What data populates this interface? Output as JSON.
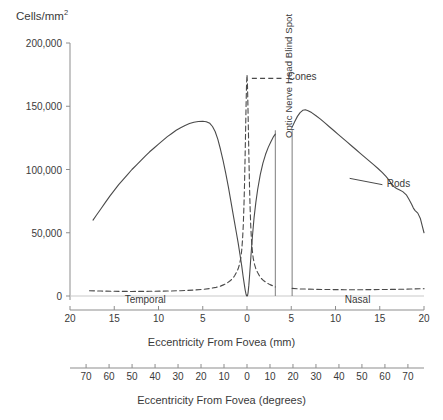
{
  "chart_data": {
    "type": "line",
    "title": "",
    "ylabel": "Cells/mm²",
    "ylabel_base": "Cells/mm",
    "ylabel_sup": "2",
    "ylim": [
      0,
      200000
    ],
    "yticks": [
      0,
      50000,
      100000,
      150000,
      200000
    ],
    "ytick_labels": [
      "0",
      "50,000",
      "100,000",
      "150,000",
      "200,000"
    ],
    "grid": false,
    "legend_position": "inside-top-center",
    "axes": [
      {
        "name": "mm-axis",
        "xlabel": "Eccentricity From Fovea (mm)",
        "xlim": [
          -20,
          20
        ],
        "xticks": [
          -20,
          -15,
          -10,
          -5,
          0,
          5,
          10,
          15,
          20
        ],
        "xtick_labels": [
          "20",
          "15",
          "10",
          "5",
          "0",
          "5",
          "10",
          "15",
          "20"
        ]
      },
      {
        "name": "degrees-axis",
        "xlabel": "Eccentricity From Fovea (degrees)",
        "xlim": [
          -77,
          77
        ],
        "xticks": [
          -70,
          -60,
          -50,
          -40,
          -30,
          -20,
          -10,
          0,
          10,
          20,
          30,
          40,
          50,
          60,
          70
        ],
        "xtick_labels": [
          "70",
          "60",
          "50",
          "40",
          "30",
          "20",
          "10",
          "0",
          "10",
          "20",
          "30",
          "40",
          "50",
          "60",
          "70"
        ]
      }
    ],
    "region_labels": [
      {
        "text": "Temporal",
        "x": -11.5
      },
      {
        "text": "Nasal",
        "x": 12.5
      }
    ],
    "annotations": [
      {
        "text": "Optic Nerve Head Blind Spot",
        "x_start": 3.2,
        "x_end": 5.1,
        "orientation": "vertical"
      }
    ],
    "blind_spot": {
      "x_start": 3.2,
      "x_end": 5.1
    },
    "series": [
      {
        "name": "Rods",
        "style": "solid",
        "color": "#4a4a4a",
        "label_x": 13.5,
        "label_y": 88000,
        "segments": [
          {
            "points": [
              [
                -17.4,
                60000
              ],
              [
                -17.0,
                64000
              ],
              [
                -16.5,
                69000
              ],
              [
                -16.0,
                74000
              ],
              [
                -15.5,
                79000
              ],
              [
                -15.0,
                83500
              ],
              [
                -14.5,
                88000
              ],
              [
                -14.0,
                92000
              ],
              [
                -13.5,
                96000
              ],
              [
                -13.0,
                100000
              ],
              [
                -12.5,
                103500
              ],
              [
                -12.0,
                107000
              ],
              [
                -11.5,
                110500
              ],
              [
                -11.0,
                114000
              ],
              [
                -10.5,
                117000
              ],
              [
                -10.0,
                120000
              ],
              [
                -9.5,
                123000
              ],
              [
                -9.0,
                126000
              ],
              [
                -8.5,
                128500
              ],
              [
                -8.0,
                131000
              ],
              [
                -7.5,
                133000
              ],
              [
                -7.0,
                134800
              ],
              [
                -6.5,
                136300
              ],
              [
                -6.0,
                137400
              ],
              [
                -5.5,
                138000
              ],
              [
                -5.0,
                138200
              ],
              [
                -4.6,
                137800
              ],
              [
                -4.2,
                136500
              ],
              [
                -3.9,
                134000
              ],
              [
                -3.6,
                130000
              ],
              [
                -3.3,
                124000
              ],
              [
                -3.0,
                116000
              ],
              [
                -2.7,
                107000
              ],
              [
                -2.4,
                97000
              ],
              [
                -2.1,
                86000
              ],
              [
                -1.8,
                74000
              ],
              [
                -1.5,
                62000
              ],
              [
                -1.2,
                50000
              ],
              [
                -1.0,
                42000
              ],
              [
                -0.8,
                33000
              ],
              [
                -0.6,
                24000
              ],
              [
                -0.45,
                16000
              ],
              [
                -0.3,
                9000
              ],
              [
                -0.2,
                4500
              ],
              [
                -0.12,
                1800
              ],
              [
                -0.06,
                400
              ],
              [
                0,
                0
              ],
              [
                0.06,
                400
              ],
              [
                0.12,
                2500
              ],
              [
                0.2,
                8000
              ],
              [
                0.3,
                17000
              ],
              [
                0.45,
                32000
              ],
              [
                0.6,
                46000
              ],
              [
                0.8,
                62000
              ],
              [
                1.0,
                74000
              ],
              [
                1.2,
                84000
              ],
              [
                1.5,
                96000
              ],
              [
                1.8,
                105000
              ],
              [
                2.1,
                112000
              ],
              [
                2.4,
                117500
              ],
              [
                2.7,
                122000
              ],
              [
                3.0,
                126000
              ],
              [
                3.2,
                128000
              ]
            ]
          },
          {
            "points": [
              [
                5.1,
                133500
              ],
              [
                5.4,
                138000
              ],
              [
                5.7,
                142000
              ],
              [
                6.0,
                145000
              ],
              [
                6.3,
                146800
              ],
              [
                6.6,
                147200
              ],
              [
                6.9,
                146500
              ],
              [
                7.3,
                145000
              ],
              [
                7.8,
                142500
              ],
              [
                8.3,
                139800
              ],
              [
                8.8,
                136800
              ],
              [
                9.3,
                133800
              ],
              [
                9.8,
                130800
              ],
              [
                10.3,
                127800
              ],
              [
                10.8,
                124800
              ],
              [
                11.3,
                121800
              ],
              [
                11.8,
                118800
              ],
              [
                12.3,
                115800
              ],
              [
                12.8,
                112800
              ],
              [
                13.3,
                109800
              ],
              [
                13.8,
                106800
              ],
              [
                14.3,
                103800
              ],
              [
                14.8,
                100800
              ],
              [
                15.3,
                97500
              ],
              [
                15.7,
                94500
              ],
              [
                16.0,
                92000
              ],
              [
                16.3,
                89000
              ],
              [
                16.6,
                86500
              ],
              [
                16.9,
                85000
              ],
              [
                17.2,
                84000
              ],
              [
                17.6,
                82500
              ],
              [
                18.0,
                80000
              ],
              [
                18.3,
                76500
              ],
              [
                18.6,
                72500
              ],
              [
                18.8,
                69500
              ],
              [
                19.0,
                67500
              ],
              [
                19.3,
                65500
              ],
              [
                19.6,
                61000
              ],
              [
                19.8,
                55500
              ],
              [
                20.0,
                50000
              ]
            ]
          }
        ]
      },
      {
        "name": "Cones",
        "style": "dashed",
        "color": "#4a4a4a",
        "legend_label_x": 4.6,
        "legend_label_y": 172000,
        "segments": [
          {
            "points": [
              [
                -17.8,
                4200
              ],
              [
                -16.5,
                3900
              ],
              [
                -15.0,
                3700
              ],
              [
                -13.0,
                3600
              ],
              [
                -11.0,
                3700
              ],
              [
                -9.0,
                3900
              ],
              [
                -7.5,
                4200
              ],
              [
                -6.0,
                4700
              ],
              [
                -5.0,
                5200
              ],
              [
                -4.2,
                5900
              ],
              [
                -3.5,
                6800
              ],
              [
                -3.0,
                7800
              ],
              [
                -2.6,
                9000
              ],
              [
                -2.2,
                10500
              ],
              [
                -1.9,
                12000
              ],
              [
                -1.6,
                14000
              ],
              [
                -1.4,
                16000
              ],
              [
                -1.2,
                18500
              ],
              [
                -1.0,
                21500
              ],
              [
                -0.85,
                25000
              ],
              [
                -0.7,
                30000
              ],
              [
                -0.6,
                36000
              ],
              [
                -0.5,
                45000
              ],
              [
                -0.42,
                56000
              ],
              [
                -0.35,
                70000
              ],
              [
                -0.28,
                88000
              ],
              [
                -0.22,
                108000
              ],
              [
                -0.16,
                130000
              ],
              [
                -0.1,
                152000
              ],
              [
                -0.05,
                168000
              ],
              [
                0,
                175000
              ],
              [
                0.05,
                168000
              ],
              [
                0.1,
                152000
              ],
              [
                0.16,
                130000
              ],
              [
                0.22,
                108000
              ],
              [
                0.28,
                88000
              ],
              [
                0.35,
                70000
              ],
              [
                0.42,
                56000
              ],
              [
                0.5,
                45000
              ],
              [
                0.6,
                36000
              ],
              [
                0.7,
                30000
              ],
              [
                0.85,
                25000
              ],
              [
                1.0,
                21500
              ],
              [
                1.2,
                18500
              ],
              [
                1.4,
                16000
              ],
              [
                1.6,
                14000
              ],
              [
                1.9,
                12000
              ],
              [
                2.2,
                10500
              ],
              [
                2.6,
                9000
              ],
              [
                3.0,
                7800
              ],
              [
                3.2,
                7200
              ]
            ]
          },
          {
            "points": [
              [
                5.1,
                6000
              ],
              [
                6.0,
                5600
              ],
              [
                7.5,
                5300
              ],
              [
                9.0,
                5100
              ],
              [
                11.0,
                5000
              ],
              [
                13.0,
                5000
              ],
              [
                15.0,
                5100
              ],
              [
                17.0,
                5300
              ],
              [
                18.5,
                5500
              ],
              [
                20.0,
                5800
              ]
            ]
          }
        ]
      }
    ]
  },
  "legend": {
    "cones": {
      "label": "Cones",
      "style": "dashed"
    },
    "rods": {
      "label": "Rods",
      "style": "solid"
    }
  }
}
